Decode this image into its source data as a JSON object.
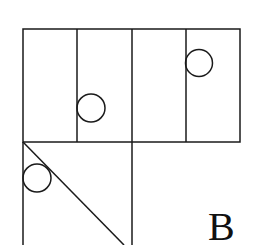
{
  "figure": {
    "label": "B",
    "stroke_color": "#1a1a1a",
    "background": "#ffffff"
  },
  "top_row": {
    "cells": [
      {
        "index": 1,
        "circle": false
      },
      {
        "index": 2,
        "circle": true,
        "circle_position": "lower-left, touching left edge"
      },
      {
        "index": 3,
        "circle": false
      },
      {
        "index": 4,
        "circle": true,
        "circle_position": "upper-left, touching left edge"
      }
    ]
  },
  "bottom_left_square": {
    "diagonal": "top-left to bottom-right",
    "circle": true,
    "circle_position": "upper-left, touching left edge and diagonal"
  }
}
